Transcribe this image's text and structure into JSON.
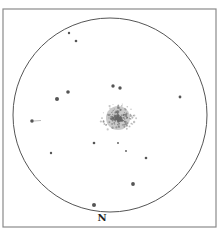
{
  "chart": {
    "orientation_label": "N",
    "colors": {
      "frame": "#8a8a8a",
      "circle": "#555555",
      "star": "#555555",
      "cluster": "#666666",
      "background": "#ffffff"
    }
  },
  "field": {
    "frame": {
      "x": 3,
      "y": 9,
      "width": 213,
      "height": 218
    },
    "circle": {
      "cx": 110,
      "cy": 115,
      "r": 97
    }
  },
  "cluster": {
    "cx": 118,
    "cy": 118,
    "core_r": 9,
    "halo_r": 17
  },
  "stars": [
    {
      "x": 69,
      "y": 33,
      "r": 1.2
    },
    {
      "x": 76,
      "y": 41,
      "r": 1.3
    },
    {
      "x": 57,
      "y": 99,
      "r": 2.0
    },
    {
      "x": 68,
      "y": 92,
      "r": 1.8
    },
    {
      "x": 113,
      "y": 86,
      "r": 1.7
    },
    {
      "x": 120,
      "y": 88,
      "r": 1.7
    },
    {
      "x": 180,
      "y": 97,
      "r": 1.4
    },
    {
      "x": 32,
      "y": 121,
      "r": 1.8,
      "trail": true
    },
    {
      "x": 94,
      "y": 143,
      "r": 1.3
    },
    {
      "x": 51,
      "y": 153,
      "r": 1.2
    },
    {
      "x": 118,
      "y": 143,
      "r": 0.9
    },
    {
      "x": 126,
      "y": 151,
      "r": 0.9
    },
    {
      "x": 146,
      "y": 158,
      "r": 1.3
    },
    {
      "x": 133,
      "y": 184,
      "r": 1.9
    },
    {
      "x": 94,
      "y": 205,
      "r": 2.0
    }
  ]
}
